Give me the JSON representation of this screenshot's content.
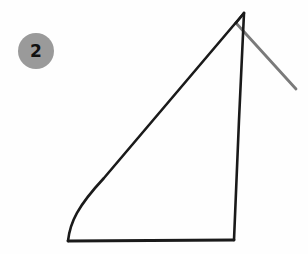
{
  "figure": {
    "label": "2",
    "background_color": "#fefefe",
    "badge": {
      "text": "2",
      "fill_color": "#9a9a9a",
      "text_color": "#111111",
      "center_x": 36,
      "center_y": 51,
      "radius": 18
    },
    "shapes": [
      {
        "name": "triangle-outline",
        "kind": "polyline",
        "stroke_color": "#1a1a1a",
        "stroke_width": 2.6,
        "closed": true,
        "points": [
          [
            244,
            13
          ],
          [
            234,
            240
          ],
          [
            68,
            241
          ],
          [
            244,
            13
          ]
        ]
      },
      {
        "name": "triangle-hypotenuse-overshoot",
        "kind": "line",
        "stroke_color": "#1a1a1a",
        "stroke_width": 2.6,
        "points": [
          [
            236,
            23
          ],
          [
            244,
            13
          ]
        ]
      },
      {
        "name": "diagonal-gray-line",
        "kind": "line",
        "stroke_color": "#7a7a7a",
        "stroke_width": 2.8,
        "points": [
          [
            236,
            23
          ],
          [
            296,
            89
          ]
        ]
      }
    ],
    "stroke_colors": {
      "primary": "#1a1a1a",
      "secondary": "#7a7a7a"
    }
  }
}
